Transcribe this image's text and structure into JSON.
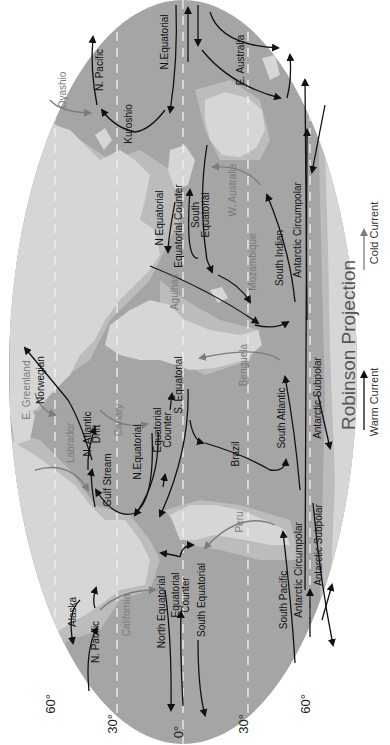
{
  "title": "Robinson Projection",
  "colors": {
    "ocean": "#a5a5a5",
    "shelf": "#bcbcbc",
    "land": "#d6d6d6",
    "warm_current": "#111111",
    "cold_current": "#7c7c7c",
    "gridline": "#f2f2f2",
    "background": "#ffffff"
  },
  "legend": {
    "warm_label": "Warm Current",
    "cold_label": "Cold Current"
  },
  "latitude_labels": [
    {
      "label": "60°",
      "x": 55,
      "y": 704
    },
    {
      "label": "30°",
      "x": 117,
      "y": 724
    },
    {
      "label": "0°",
      "x": 183,
      "y": 732
    },
    {
      "label": "30°",
      "x": 248,
      "y": 724
    },
    {
      "label": "60°",
      "x": 310,
      "y": 704
    }
  ],
  "currents": {
    "warm": [
      {
        "label": "N. Pacific",
        "x": 103,
        "y": 70
      },
      {
        "label": "N.Equatorial",
        "x": 168,
        "y": 42
      },
      {
        "label": "E. Australia",
        "x": 244,
        "y": 60
      },
      {
        "label": "Kuroshio",
        "x": 132,
        "y": 124
      },
      {
        "label": "Antarctic Circumpolar",
        "x": 301,
        "y": 230
      },
      {
        "label": "N Equatorial",
        "x": 163,
        "y": 218
      },
      {
        "label": "Equatorial Counter",
        "x": 182,
        "y": 226
      },
      {
        "label": "South",
        "x": 199,
        "y": 215
      },
      {
        "label": "Equatorial",
        "x": 209,
        "y": 215
      },
      {
        "label": "South Indian",
        "x": 283,
        "y": 258
      },
      {
        "label": "N. Atlantic",
        "x": 91,
        "y": 434
      },
      {
        "label": "Drift",
        "x": 100,
        "y": 434
      },
      {
        "label": "Norwegian",
        "x": 44,
        "y": 380
      },
      {
        "label": "Gulf Stream",
        "x": 111,
        "y": 480
      },
      {
        "label": "N.Equatorial",
        "x": 141,
        "y": 452
      },
      {
        "label": "Equatorial",
        "x": 161,
        "y": 430
      },
      {
        "label": "Counter",
        "x": 171,
        "y": 430
      },
      {
        "label": "S. Equatorial",
        "x": 182,
        "y": 385
      },
      {
        "label": "Brazil",
        "x": 239,
        "y": 454
      },
      {
        "label": "South Atlantic",
        "x": 285,
        "y": 418
      },
      {
        "label": "Antarctic Subpolar",
        "x": 321,
        "y": 398
      },
      {
        "label": "Alaska",
        "x": 76,
        "y": 612
      },
      {
        "label": "N. Pacific",
        "x": 99,
        "y": 642
      },
      {
        "label": "North Equatorial",
        "x": 165,
        "y": 612
      },
      {
        "label": "Equatorial",
        "x": 179,
        "y": 595
      },
      {
        "label": "Counter",
        "x": 189,
        "y": 595
      },
      {
        "label": "South Equatorial",
        "x": 205,
        "y": 600
      },
      {
        "label": "South Pacific",
        "x": 287,
        "y": 600
      },
      {
        "label": "Antarctic Circumpolar",
        "x": 302,
        "y": 570
      },
      {
        "label": "Antarctic Subpolar",
        "x": 322,
        "y": 545
      }
    ],
    "cold": [
      {
        "label": "Oyashio",
        "x": 66,
        "y": 90
      },
      {
        "label": "W. Australia",
        "x": 236,
        "y": 190
      },
      {
        "label": "Agulhas",
        "x": 178,
        "y": 292
      },
      {
        "label": "Mozambique",
        "x": 256,
        "y": 262
      },
      {
        "label": "E. Greenland",
        "x": 30,
        "y": 390
      },
      {
        "label": "Labrador",
        "x": 74,
        "y": 443
      },
      {
        "label": "Canary",
        "x": 122,
        "y": 420
      },
      {
        "label": "Benguela",
        "x": 247,
        "y": 365
      },
      {
        "label": "Peru",
        "x": 243,
        "y": 522
      },
      {
        "label": "California",
        "x": 130,
        "y": 615
      }
    ]
  }
}
